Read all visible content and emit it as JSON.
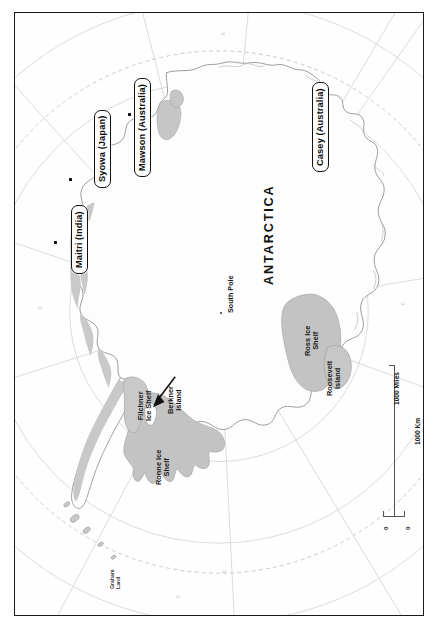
{
  "map": {
    "title": "ANTARCTICA",
    "pole_label": "South Pole",
    "orientation_note": "rotated",
    "colors": {
      "ice_shelf_fill": "#c3c3c3",
      "land_fill": "#ffffff",
      "coastline": "#8d8d8d",
      "graticule": "#cfcfcf",
      "frame": "#1a1a1a",
      "text": "#111111"
    }
  },
  "stations": [
    {
      "name": "Maitri (India)",
      "country": "India"
    },
    {
      "name": "Syowa (Japan)",
      "country": "Japan"
    },
    {
      "name": "Mawson (Australia)",
      "country": "Australia"
    },
    {
      "name": "Casey (Australia)",
      "country": "Australia"
    }
  ],
  "features": [
    {
      "name": "Filchner\nIce Shelf"
    },
    {
      "name": "Berkner\nIsland"
    },
    {
      "name": "Ronne Ice\nShelf"
    },
    {
      "name": "Ross Ice\nShelf"
    },
    {
      "name": "Roosevelt\nIsland"
    },
    {
      "name": "Graham\nLand"
    }
  ],
  "scalebar": {
    "miles_label": "1000 Miles",
    "km_label": "1000 Km",
    "zero_left": "0",
    "zero_right": "0"
  },
  "graticule_labels": [
    "0",
    "0",
    "0",
    "0",
    "0"
  ]
}
